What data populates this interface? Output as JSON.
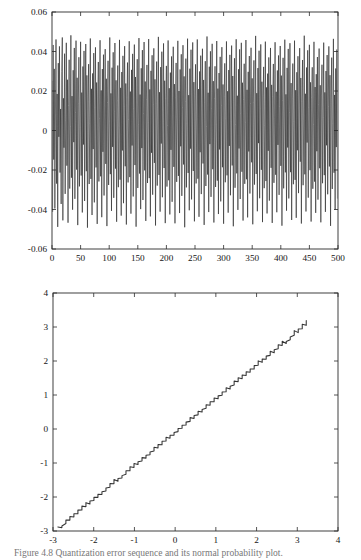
{
  "figure": {
    "caption": "Figure 4.8   Quantization error sequence and its normal probability plot.",
    "background_color": "#ffffff",
    "line_color": "#262626",
    "axis_color": "#2b2b2b"
  },
  "chart_data": [
    {
      "id": "quantization-error-series",
      "type": "line",
      "title": "",
      "xlabel": "",
      "ylabel": "",
      "xlim": [
        0,
        500
      ],
      "ylim": [
        -0.06,
        0.06
      ],
      "grid": false,
      "legend": null,
      "xticks": [
        0,
        50,
        100,
        150,
        200,
        250,
        300,
        350,
        400,
        450,
        500
      ],
      "xticklabels": [
        "0",
        "50",
        "100",
        "150",
        "200",
        "250",
        "300",
        "350",
        "400",
        "450",
        "500"
      ],
      "yticks": [
        -0.06,
        -0.04,
        -0.02,
        0,
        0.02,
        0.04,
        0.06
      ],
      "yticklabels": [
        "-0.06",
        "-0.04",
        "-0.02",
        "0",
        "0.02",
        "0.04",
        "0.06"
      ],
      "series": [
        {
          "name": "error",
          "n_points": 500,
          "x_start": 0,
          "x_step": 1,
          "description": "Dense zero-mean uniformly distributed quantization error, full-scale roughly +/-0.05",
          "values": [
            0.0251,
            -0.0412,
            0.0433,
            -0.0147,
            0.0312,
            -0.0395,
            0.0078,
            0.0461,
            -0.0269,
            0.0185,
            -0.0488,
            0.0341,
            -0.0032,
            0.0426,
            -0.0213,
            0.0109,
            -0.0372,
            0.0298,
            0.0471,
            -0.0455,
            0.0163,
            -0.0087,
            0.0389,
            -0.0321,
            0.0049,
            0.0444,
            -0.0178,
            0.0257,
            -0.0467,
            0.0126,
            0.0358,
            -0.0294,
            0.0021,
            0.0482,
            -0.0239,
            0.0174,
            -0.0401,
            0.0305,
            -0.0059,
            0.0418,
            -0.0346,
            0.0092,
            0.0455,
            -0.0198,
            0.0267,
            -0.0479,
            0.0135,
            0.0371,
            -0.0283,
            0.0014,
            0.0449,
            -0.0228,
            0.0192,
            -0.0415,
            0.0324,
            -0.0071,
            0.0403,
            -0.0357,
            0.0104,
            0.0438,
            -0.0206,
            0.0279,
            -0.0492,
            0.0148,
            0.0336,
            -0.0271,
            0.0037,
            0.0466,
            -0.0245,
            0.0211,
            -0.0428,
            0.0289,
            -0.0094,
            0.0392,
            -0.0364,
            0.0117,
            0.0421,
            -0.0187,
            0.0243,
            -0.0473,
            0.0159,
            0.0347,
            -0.0258,
            0.0062,
            0.0457,
            -0.0232,
            0.0203,
            -0.0439,
            0.0311,
            -0.0108,
            0.0384,
            -0.0329,
            0.0129,
            0.0412,
            -0.0169,
            0.0262,
            -0.0484,
            0.0141,
            0.0353,
            -0.0276,
            0.0044,
            0.0471,
            -0.0221,
            0.0188,
            -0.0407,
            0.0318,
            -0.0083,
            0.0396,
            -0.0341,
            0.0098,
            0.0443,
            -0.0193,
            0.0254,
            -0.0462,
            0.0152,
            0.0329,
            -0.0287,
            0.0027,
            0.0459,
            -0.0249,
            0.0216,
            -0.0431,
            0.0296,
            -0.0101,
            0.0378,
            -0.0368,
            0.0121,
            0.0427,
            -0.0181,
            0.0238,
            -0.0476,
            0.0166,
            0.0344,
            -0.0263,
            0.0055,
            0.0452,
            -0.0236,
            0.0197,
            -0.0421,
            0.0307,
            -0.0076,
            0.0388,
            -0.0334,
            0.0112,
            0.0435,
            -0.0175,
            0.0271,
            -0.0487,
            0.0144,
            0.0361,
            -0.0291,
            0.0032,
            0.0468,
            -0.0218,
            0.0182,
            -0.0398,
            0.0315,
            -0.0089,
            0.0407,
            -0.0352,
            0.0085,
            0.0448,
            -0.0202,
            0.0248,
            -0.0458,
            0.0156,
            0.0332,
            -0.0266,
            0.0041,
            0.0463,
            -0.0241,
            0.0208,
            -0.0435,
            0.0302,
            -0.0113,
            0.0381,
            -0.0325,
            0.0132,
            0.0416,
            -0.0164,
            0.0259,
            -0.0481,
            0.0138,
            0.0349,
            -0.0279,
            0.0018,
            0.0474,
            -0.0225,
            0.0194,
            -0.0411,
            0.0321,
            -0.0066,
            0.0399,
            -0.0338,
            0.0107,
            0.0441,
            -0.019,
            0.0252,
            -0.0469,
            0.0161,
            0.0327,
            -0.0284,
            0.0024,
            0.0456,
            -0.0252,
            0.0214,
            -0.0425,
            0.0293,
            -0.0098,
            0.0375,
            -0.0361,
            0.0124,
            0.0424,
            -0.0184,
            0.0235,
            -0.047,
            0.0169,
            0.0342,
            -0.026,
            0.0058,
            0.0454,
            -0.023,
            0.02,
            -0.0418,
            0.0309,
            -0.008,
            0.0386,
            -0.0331,
            0.0115,
            0.0432,
            -0.0172,
            0.0274,
            -0.049,
            0.0147,
            0.0364,
            -0.0288,
            0.0035,
            0.0465,
            -0.0215,
            0.0179,
            -0.0404,
            0.0313,
            -0.0092,
            0.0409,
            -0.0349,
            0.0088,
            0.0446,
            -0.0205,
            0.0245,
            -0.046,
            0.0154,
            0.0335,
            -0.0268,
            0.0038,
            0.0461,
            -0.0244,
            0.021,
            -0.0437,
            0.0299,
            -0.011,
            0.0379,
            -0.0322,
            0.0134,
            0.0414,
            -0.0167,
            0.0256,
            -0.0478,
            0.014,
            0.0351,
            -0.0281,
            0.002,
            0.0476,
            -0.0223,
            0.0191,
            -0.0413,
            0.0323,
            -0.0069,
            0.0401,
            -0.0336,
            0.011,
            0.0439,
            -0.0196,
            0.025,
            -0.0466,
            0.0163,
            0.0325,
            -0.0286,
            0.0029,
            0.0453,
            -0.0254,
            0.0212,
            -0.0423,
            0.0291,
            -0.0096,
            0.0373,
            -0.0359,
            0.0127,
            0.0422,
            -0.0186,
            0.0233,
            -0.0472,
            0.0171,
            0.034,
            -0.0262,
            0.006,
            0.0451,
            -0.0227,
            0.0199,
            -0.0416,
            0.0306,
            -0.0078,
            0.0383,
            -0.0328,
            0.0118,
            0.043,
            -0.0177,
            0.0276,
            -0.0485,
            0.015,
            0.0366,
            -0.029,
            0.003,
            0.0462,
            -0.0217,
            0.0176,
            -0.0402,
            0.031,
            -0.0091,
            0.0411,
            -0.0347,
            0.0086,
            0.0444,
            -0.0209,
            0.0242,
            -0.0456,
            0.0157,
            0.0338,
            -0.027,
            0.0042,
            0.0458,
            -0.0247,
            0.0206,
            -0.044,
            0.0297,
            -0.0106,
            0.0377,
            -0.0319,
            0.0136,
            0.0419,
            -0.0161,
            0.0264,
            -0.0475,
            0.0143,
            0.0355,
            -0.0274,
            0.0023,
            0.0479,
            -0.022,
            0.0189,
            -0.0409,
            0.0316,
            -0.0064,
            0.0404,
            -0.0343,
            0.0113,
            0.0436,
            -0.0199,
            0.0247,
            -0.0464,
            0.0165,
            0.0322,
            -0.0292,
            0.0026,
            0.045,
            -0.0256,
            0.0218,
            -0.042,
            0.0288,
            -0.0103,
            0.037,
            -0.0355,
            0.013,
            0.0418,
            -0.0189,
            0.0231,
            -0.0468,
            0.0173,
            0.0337,
            -0.0265,
            0.0063,
            0.0447,
            -0.0224,
            0.0196,
            -0.0414,
            0.0304,
            -0.0073,
            0.038,
            -0.0326,
            0.012,
            0.0428,
            -0.0179,
            0.0278,
            -0.0482,
            0.0153,
            0.0368,
            -0.0293,
            0.0033,
            0.046,
            -0.0212,
            0.0183,
            -0.0406,
            0.0317,
            -0.0086,
            0.0413,
            -0.0344,
            0.009,
            0.0442,
            -0.0211,
            0.024,
            -0.0453,
            0.016,
            0.0339,
            -0.0272,
            0.0046,
            0.0455,
            -0.025,
            0.0204,
            -0.0442,
            0.0295,
            -0.01,
            0.0376,
            -0.0317,
            0.0139,
            0.0417,
            -0.0158,
            0.0266,
            -0.0471,
            0.0146,
            0.0357,
            -0.0277,
            0.0028,
            0.048,
            -0.0222,
            0.0186,
            -0.041,
            0.0319,
            -0.0061,
            0.0406,
            -0.034,
            0.0116,
            0.0434,
            -0.0201,
            0.0244,
            -0.0461,
            0.0168,
            0.032,
            -0.0295,
            0.0031,
            0.0449,
            -0.0259,
            0.022,
            -0.0417,
            0.0285,
            -0.0105,
            0.0372,
            -0.035,
            0.0133,
            0.0415,
            -0.0191,
            0.0229,
            -0.0465,
            0.0175,
            0.0333,
            -0.0267,
            0.0066,
            0.0445,
            -0.0226,
            0.0193,
            -0.0412,
            0.0301,
            -0.0075,
            0.0382,
            -0.0323,
            0.0122,
            0.0426,
            -0.0182,
            0.028,
            -0.0483,
            0.0155,
            0.0369,
            -0.0296,
            0.0036,
            0.0464,
            -0.0214,
            0.018,
            -0.04,
            0.0314,
            -0.0084,
            0.041,
            -0.0345,
            0.0093,
            0.044,
            -0.0207,
            0.0241
          ]
        }
      ]
    },
    {
      "id": "normal-probability-plot",
      "type": "line",
      "title": "",
      "xlabel": "",
      "ylabel": "",
      "xlim": [
        -3,
        4
      ],
      "ylim": [
        -3,
        4
      ],
      "grid": false,
      "legend": null,
      "xticks": [
        -3,
        -2,
        -1,
        0,
        1,
        2,
        3,
        4
      ],
      "xticklabels": [
        "-3",
        "-2",
        "-1",
        "0",
        "1",
        "2",
        "3",
        "4"
      ],
      "yticks": [
        -3,
        -2,
        -1,
        0,
        1,
        2,
        3,
        4
      ],
      "yticklabels": [
        "-3",
        "-2",
        "-1",
        "0",
        "1",
        "2",
        "3",
        "4"
      ],
      "series": [
        {
          "name": "quantile-quantile",
          "description": "Near-linear staircase trace from (-2.88,-2.88) to (3.22,3.12); small quantization steps along an approximately unit-slope diagonal",
          "x_start": -2.88,
          "x_end": 3.22,
          "y_start": -2.88,
          "y_end": 3.12,
          "slope": 1.0,
          "intercept": 0.0,
          "staircase_steps": 62
        }
      ]
    }
  ]
}
